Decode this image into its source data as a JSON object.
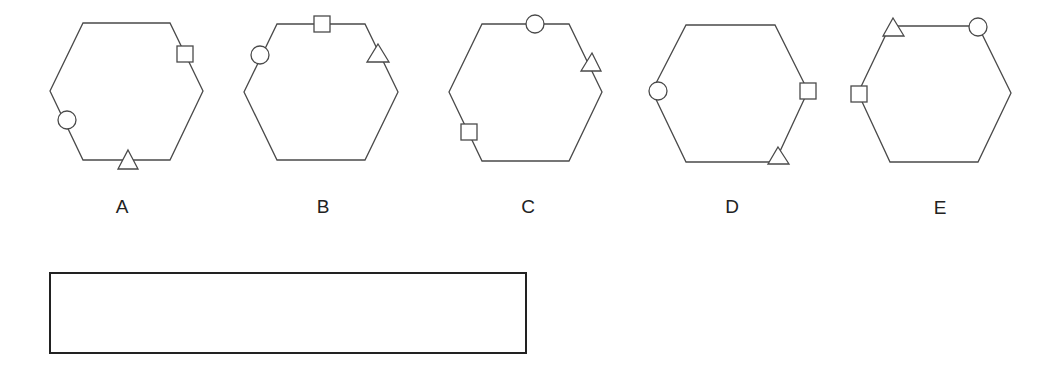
{
  "colors": {
    "stroke": "#4a4a4a",
    "label": "#222222",
    "box_border": "#222222"
  },
  "options": [
    {
      "label": "A",
      "label_pos": [
        122,
        206
      ],
      "hexagon": [
        [
          83,
          23
        ],
        [
          170,
          23
        ],
        [
          203,
          91
        ],
        [
          170,
          160
        ],
        [
          83,
          160
        ],
        [
          50,
          91
        ]
      ],
      "symbols": [
        {
          "shape": "square",
          "x": 177,
          "y": 46,
          "size": 16
        },
        {
          "shape": "circle",
          "cx": 67,
          "cy": 120,
          "r": 9
        },
        {
          "shape": "triangle",
          "points": [
            [
              128,
              150
            ],
            [
              138,
              169
            ],
            [
              118,
              169
            ]
          ]
        }
      ]
    },
    {
      "label": "B",
      "label_pos": [
        323,
        206
      ],
      "hexagon": [
        [
          277,
          24
        ],
        [
          365,
          24
        ],
        [
          398,
          92
        ],
        [
          365,
          160
        ],
        [
          277,
          160
        ],
        [
          244,
          92
        ]
      ],
      "symbols": [
        {
          "shape": "square",
          "x": 314,
          "y": 16,
          "size": 16
        },
        {
          "shape": "circle",
          "cx": 260,
          "cy": 55,
          "r": 9
        },
        {
          "shape": "triangle",
          "points": [
            [
              378,
              44
            ],
            [
              389,
              62
            ],
            [
              367,
              62
            ]
          ]
        }
      ]
    },
    {
      "label": "C",
      "label_pos": [
        528,
        206
      ],
      "hexagon": [
        [
          482,
          24
        ],
        [
          569,
          24
        ],
        [
          602,
          92
        ],
        [
          569,
          161
        ],
        [
          482,
          161
        ],
        [
          449,
          92
        ]
      ],
      "symbols": [
        {
          "shape": "circle",
          "cx": 535,
          "cy": 24,
          "r": 9
        },
        {
          "shape": "triangle",
          "points": [
            [
              592,
              53
            ],
            [
              601,
              71
            ],
            [
              581,
              71
            ]
          ]
        },
        {
          "shape": "square",
          "x": 461,
          "y": 124,
          "size": 16
        }
      ]
    },
    {
      "label": "D",
      "label_pos": [
        732,
        206
      ],
      "hexagon": [
        [
          686,
          25
        ],
        [
          775,
          25
        ],
        [
          808,
          91
        ],
        [
          775,
          162
        ],
        [
          686,
          162
        ],
        [
          652,
          91
        ]
      ],
      "symbols": [
        {
          "shape": "circle",
          "cx": 658,
          "cy": 91,
          "r": 9
        },
        {
          "shape": "square",
          "x": 800,
          "y": 83,
          "size": 16
        },
        {
          "shape": "triangle",
          "points": [
            [
              778,
              147
            ],
            [
              789,
              164
            ],
            [
              768,
              164
            ]
          ]
        }
      ]
    },
    {
      "label": "E",
      "label_pos": [
        940,
        207
      ],
      "hexagon": [
        [
          890,
          26
        ],
        [
          978,
          26
        ],
        [
          1011,
          93
        ],
        [
          978,
          162
        ],
        [
          890,
          162
        ],
        [
          858,
          93
        ]
      ],
      "symbols": [
        {
          "shape": "triangle",
          "points": [
            [
              893,
              18
            ],
            [
              904,
              36
            ],
            [
              883,
              36
            ]
          ]
        },
        {
          "shape": "circle",
          "cx": 978,
          "cy": 27,
          "r": 9
        },
        {
          "shape": "square",
          "x": 851,
          "y": 86,
          "size": 16
        }
      ]
    }
  ],
  "answer_box": {
    "value": ""
  }
}
